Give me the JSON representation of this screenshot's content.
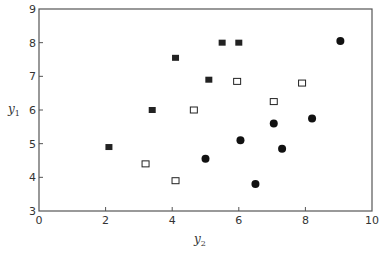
{
  "chart_data": {
    "type": "scatter",
    "title": "",
    "xlabel": "y2",
    "ylabel": "y1",
    "xlim": [
      0,
      10
    ],
    "ylim": [
      3,
      9
    ],
    "xticks": [
      0,
      2,
      4,
      6,
      8,
      10
    ],
    "yticks": [
      3,
      4,
      5,
      6,
      7,
      8,
      9
    ],
    "grid": false,
    "legend": null,
    "series": [
      {
        "name": "filled squares",
        "marker": "square-filled",
        "color": "#222222",
        "points": [
          {
            "x": 2.1,
            "y": 4.9
          },
          {
            "x": 3.4,
            "y": 6.0
          },
          {
            "x": 4.1,
            "y": 7.55
          },
          {
            "x": 5.1,
            "y": 6.9
          },
          {
            "x": 5.5,
            "y": 8.0
          },
          {
            "x": 6.0,
            "y": 8.0
          }
        ]
      },
      {
        "name": "open squares",
        "marker": "square-open",
        "color": "#222222",
        "points": [
          {
            "x": 3.2,
            "y": 4.4
          },
          {
            "x": 4.1,
            "y": 3.9
          },
          {
            "x": 4.65,
            "y": 6.0
          },
          {
            "x": 5.95,
            "y": 6.85
          },
          {
            "x": 7.05,
            "y": 6.25
          },
          {
            "x": 7.9,
            "y": 6.8
          }
        ]
      },
      {
        "name": "filled circles",
        "marker": "circle-filled",
        "color": "#111111",
        "points": [
          {
            "x": 5.0,
            "y": 4.55
          },
          {
            "x": 6.05,
            "y": 5.1
          },
          {
            "x": 6.5,
            "y": 3.8
          },
          {
            "x": 7.05,
            "y": 5.6
          },
          {
            "x": 7.3,
            "y": 4.85
          },
          {
            "x": 8.2,
            "y": 5.75
          },
          {
            "x": 9.05,
            "y": 8.05
          }
        ]
      }
    ]
  },
  "axes": {
    "x_label_main": "y",
    "x_label_sub": "2",
    "y_label_main": "y",
    "y_label_sub": "1"
  }
}
